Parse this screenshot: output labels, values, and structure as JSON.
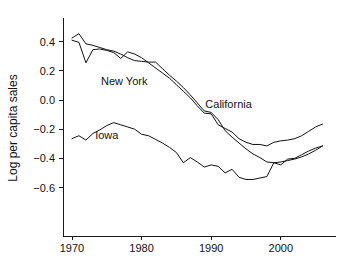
{
  "chart_data": {
    "type": "line",
    "title": "",
    "subtitle": "",
    "xlabel": "",
    "ylabel": "Log per capita sales",
    "xlim": [
      1970,
      2006
    ],
    "ylim": [
      -0.78,
      0.47
    ],
    "grid": false,
    "legend_position": "inline-labels",
    "x_ticks": [
      1970,
      1980,
      1990,
      2000
    ],
    "x_tick_labels": [
      "1970",
      "1980",
      "1990",
      "2000"
    ],
    "y_ticks": [
      0.4,
      0.2,
      0.0,
      -0.2,
      -0.4,
      -0.6
    ],
    "y_tick_labels": [
      "0.4",
      "0.2",
      "0.0",
      "-0.2",
      "-0.4",
      "-0.6"
    ],
    "annotations": [
      {
        "text": "New York",
        "x": 1977.5,
        "y": 0.105
      },
      {
        "text": "California",
        "x": 1992.5,
        "y": -0.055
      },
      {
        "text": "Iowa",
        "x": 1975.0,
        "y": -0.265
      }
    ],
    "series": [
      {
        "name": "New York",
        "color": "#111111",
        "x": [
          1970,
          1971,
          1972,
          1973,
          1974,
          1975,
          1976,
          1977,
          1978,
          1979,
          1980,
          1981,
          1982,
          1983,
          1984,
          1985,
          1986,
          1987,
          1988,
          1989,
          1990,
          1991,
          1992,
          1993,
          1994,
          1995,
          1996,
          1997,
          1998,
          1999,
          2000,
          2001,
          2002,
          2003,
          2004,
          2005,
          2006
        ],
        "values": [
          0.425,
          0.455,
          0.385,
          0.375,
          0.36,
          0.345,
          0.335,
          0.315,
          0.29,
          0.27,
          0.265,
          0.26,
          0.26,
          0.215,
          0.17,
          0.13,
          0.085,
          0.035,
          -0.02,
          -0.075,
          -0.085,
          -0.135,
          -0.21,
          -0.255,
          -0.295,
          -0.335,
          -0.37,
          -0.395,
          -0.425,
          -0.43,
          -0.425,
          -0.415,
          -0.405,
          -0.39,
          -0.37,
          -0.345,
          -0.315
        ]
      },
      {
        "name": "California",
        "color": "#111111",
        "x": [
          1970,
          1971,
          1972,
          1973,
          1974,
          1975,
          1976,
          1977,
          1978,
          1979,
          1980,
          1981,
          1982,
          1983,
          1984,
          1985,
          1986,
          1987,
          1988,
          1989,
          1990,
          1991,
          1992,
          1993,
          1994,
          1995,
          1996,
          1997,
          1998,
          1999,
          2000,
          2001,
          2002,
          2003,
          2004,
          2005,
          2006
        ],
        "values": [
          0.41,
          0.395,
          0.255,
          0.345,
          0.35,
          0.34,
          0.325,
          0.285,
          0.33,
          0.315,
          0.29,
          0.255,
          0.22,
          0.185,
          0.15,
          0.105,
          0.06,
          0.015,
          -0.04,
          -0.09,
          -0.095,
          -0.17,
          -0.195,
          -0.22,
          -0.265,
          -0.29,
          -0.305,
          -0.305,
          -0.315,
          -0.29,
          -0.28,
          -0.275,
          -0.265,
          -0.245,
          -0.215,
          -0.185,
          -0.165
        ]
      },
      {
        "name": "Iowa",
        "color": "#111111",
        "x": [
          1970,
          1971,
          1972,
          1973,
          1974,
          1975,
          1976,
          1977,
          1978,
          1979,
          1980,
          1981,
          1982,
          1983,
          1984,
          1985,
          1986,
          1987,
          1988,
          1989,
          1990,
          1991,
          1992,
          1993,
          1994,
          1995,
          1996,
          1997,
          1998,
          1999,
          2000,
          2001,
          2002,
          2003,
          2004,
          2005,
          2006
        ],
        "values": [
          -0.265,
          -0.245,
          -0.275,
          -0.23,
          -0.205,
          -0.175,
          -0.155,
          -0.17,
          -0.185,
          -0.2,
          -0.235,
          -0.245,
          -0.27,
          -0.295,
          -0.325,
          -0.36,
          -0.43,
          -0.395,
          -0.425,
          -0.46,
          -0.445,
          -0.455,
          -0.5,
          -0.475,
          -0.53,
          -0.545,
          -0.545,
          -0.535,
          -0.525,
          -0.43,
          -0.445,
          -0.405,
          -0.4,
          -0.375,
          -0.35,
          -0.33,
          -0.315
        ]
      }
    ]
  },
  "axis": {
    "y_title": "Log per capita sales"
  }
}
